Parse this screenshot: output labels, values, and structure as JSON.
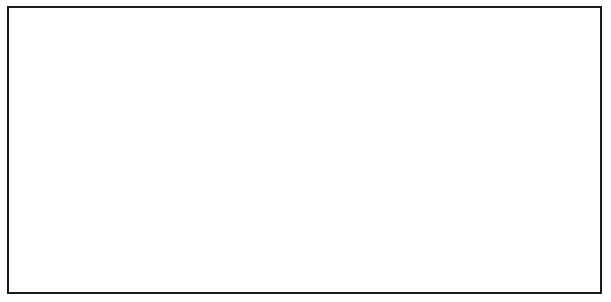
{
  "figure": {
    "panel_count": 3,
    "frame_color": "#1b1b1b",
    "background": "#ffffff"
  },
  "palette": {
    "ocean_bulge": "#6f6f6f",
    "land": "#8e8e8e",
    "land_light": "#c9c9c9",
    "earth_outline": "#1b1b1b",
    "arrow_fill_light": "#f2f2f2",
    "arrow_fill_dark": "#b9b9b9",
    "moon_gray": "#9a9a9a",
    "motion_arrow": "#a8a8a8",
    "text": "#111111"
  },
  "labels": {
    "moon": "Moon",
    "pull_line_1": "Pull",
    "pull_line_2": "of the",
    "pull_line_3": "moon",
    "high_tide": "High tide",
    "low_tide_line_1": "Low",
    "low_tide_line_2": "tide",
    "north_pole_line_1": "North",
    "north_pole_line_2": "Pole",
    "los_angeles_line_1": "Los",
    "los_angeles_line_2": "Angeles"
  },
  "panels": [
    {
      "id": "panel-0",
      "name": "panel-moon-overhead",
      "moon": {
        "label": "Moon",
        "has_dashed_circle": false,
        "has_motion_arrow": false,
        "dashed_offset_x": 0
      },
      "pull_arrow": {
        "label_lines": [
          "Pull",
          "of the",
          "moon"
        ],
        "direction": "up"
      },
      "earth": {
        "north_pole_label": "North\nPole",
        "high_tide_top": "High tide",
        "high_tide_bottom": "High tide",
        "low_tide_left": "Low\ntide",
        "low_tide_right": "Low\ntide"
      },
      "los_angeles": {
        "label": "Los Angeles",
        "visible_label": false,
        "marker_position": "top-of-earth",
        "leader_side": "right"
      }
    },
    {
      "id": "panel-1",
      "name": "panel-moon-moving-quarter",
      "moon": {
        "label": "Moon",
        "has_dashed_circle": true,
        "has_motion_arrow": true,
        "dashed_offset_x": 8
      },
      "pull_arrow": {
        "label_lines": [
          "Pull",
          "of the",
          "moon"
        ],
        "direction": "up"
      },
      "earth": {
        "north_pole_label": "North\nPole",
        "high_tide_top": "High tide",
        "high_tide_bottom": "High tide",
        "low_tide_left": "Low\ntide",
        "low_tide_right": "Low\ntide"
      },
      "los_angeles": {
        "label": "Los Angeles",
        "visible_label": false,
        "marker_position": "left-of-earth",
        "leader_side": "left"
      }
    },
    {
      "id": "panel-2",
      "name": "panel-moon-moving-half",
      "moon": {
        "label": "Moon",
        "has_dashed_circle": true,
        "has_motion_arrow": true,
        "dashed_offset_x": 16
      },
      "pull_arrow": {
        "label_lines": [
          "Pull",
          "of the",
          "moon"
        ],
        "direction": "up"
      },
      "earth": {
        "north_pole_label": "North\nPole",
        "high_tide_top": "High  tide",
        "high_tide_bottom": "High tide",
        "low_tide_left": "Low\ntide",
        "low_tide_right": "Low\ntide"
      },
      "los_angeles": {
        "label": "Los Angeles",
        "visible_label": true,
        "marker_position": "bottom-of-earth",
        "leader_side": "left"
      }
    }
  ],
  "shared_callouts": [
    {
      "id": "callout-la-center",
      "label_line_1": "Los",
      "label_line_2": "Angeles",
      "serves_panels": [
        0,
        1
      ]
    },
    {
      "id": "callout-la-right",
      "label_line_1": "Los",
      "label_line_2": "Angeles",
      "serves_panels": [
        2
      ]
    }
  ]
}
